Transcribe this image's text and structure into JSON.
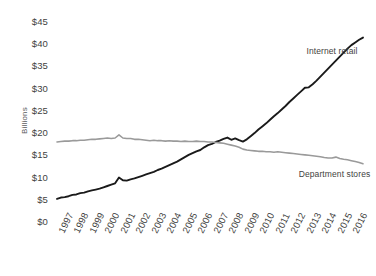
{
  "chart_data": {
    "type": "line",
    "title": "",
    "subtitle": "",
    "xlabel": "",
    "ylabel": "Billions",
    "xlim": [
      1997,
      2016.75
    ],
    "ylim": [
      0,
      45
    ],
    "grid": false,
    "legend_position": "inline-annotation",
    "y_ticks": [
      "$0",
      "$5",
      "$10",
      "$15",
      "$20",
      "$25",
      "$30",
      "$35",
      "$40",
      "$45"
    ],
    "y_tick_values": [
      0,
      5,
      10,
      15,
      20,
      25,
      30,
      35,
      40,
      45
    ],
    "categories": [
      "1997",
      "1998",
      "1999",
      "2000",
      "2001",
      "2002",
      "2003",
      "2004",
      "2005",
      "2006",
      "2007",
      "2008",
      "2009",
      "2010",
      "2011",
      "2012",
      "2013",
      "2014",
      "2015",
      "2016"
    ],
    "colors": {
      "internet_retail": "#1a1a1a",
      "department_stores": "#9a9a9a",
      "text": "#3f3f41",
      "axis_label": "#58595b",
      "background": "#ffffff"
    },
    "series": [
      {
        "name": "Internet retail",
        "color": "#1a1a1a",
        "label_x": 2013.1,
        "label_y": 38.2,
        "x": [
          1997.0,
          1997.25,
          1997.5,
          1997.75,
          1998.0,
          1998.25,
          1998.5,
          1998.75,
          1999.0,
          1999.25,
          1999.5,
          1999.75,
          2000.0,
          2000.25,
          2000.5,
          2000.75,
          2001.0,
          2001.25,
          2001.5,
          2001.75,
          2002.0,
          2002.25,
          2002.5,
          2002.75,
          2003.0,
          2003.25,
          2003.5,
          2003.75,
          2004.0,
          2004.25,
          2004.5,
          2004.75,
          2005.0,
          2005.25,
          2005.5,
          2005.75,
          2006.0,
          2006.25,
          2006.5,
          2006.75,
          2007.0,
          2007.25,
          2007.5,
          2007.75,
          2008.0,
          2008.25,
          2008.5,
          2008.75,
          2009.0,
          2009.25,
          2009.5,
          2009.75,
          2010.0,
          2010.25,
          2010.5,
          2010.75,
          2011.0,
          2011.25,
          2011.5,
          2011.75,
          2012.0,
          2012.25,
          2012.5,
          2012.75,
          2013.0,
          2013.25,
          2013.5,
          2013.75,
          2014.0,
          2014.25,
          2014.5,
          2014.75,
          2015.0,
          2015.25,
          2015.5,
          2015.75,
          2016.0,
          2016.25,
          2016.5,
          2016.75
        ],
        "values": [
          5.2,
          5.5,
          5.6,
          5.8,
          6.1,
          6.2,
          6.5,
          6.6,
          6.9,
          7.1,
          7.3,
          7.5,
          7.8,
          8.1,
          8.4,
          8.7,
          10.0,
          9.4,
          9.3,
          9.6,
          9.8,
          10.1,
          10.4,
          10.7,
          11.0,
          11.3,
          11.7,
          12.0,
          12.4,
          12.8,
          13.2,
          13.6,
          14.1,
          14.6,
          15.1,
          15.5,
          15.9,
          16.2,
          16.8,
          17.3,
          17.6,
          18.0,
          18.3,
          18.7,
          19.0,
          18.5,
          18.8,
          18.4,
          18.1,
          18.6,
          19.3,
          20.0,
          20.8,
          21.5,
          22.2,
          23.0,
          23.8,
          24.5,
          25.3,
          26.1,
          27.0,
          27.8,
          28.6,
          29.4,
          30.2,
          30.3,
          31.0,
          31.8,
          32.7,
          33.6,
          34.5,
          35.4,
          36.3,
          37.2,
          38.1,
          39.0,
          39.8,
          40.4,
          41.0,
          41.5
        ]
      },
      {
        "name": "Department stores",
        "color": "#9a9a9a",
        "label_x": 2012.6,
        "label_y": 10.6,
        "x": [
          1997.0,
          1997.25,
          1997.5,
          1997.75,
          1998.0,
          1998.25,
          1998.5,
          1998.75,
          1999.0,
          1999.25,
          1999.5,
          1999.75,
          2000.0,
          2000.25,
          2000.5,
          2000.75,
          2001.0,
          2001.25,
          2001.5,
          2001.75,
          2002.0,
          2002.25,
          2002.5,
          2002.75,
          2003.0,
          2003.25,
          2003.5,
          2003.75,
          2004.0,
          2004.25,
          2004.5,
          2004.75,
          2005.0,
          2005.25,
          2005.5,
          2005.75,
          2006.0,
          2006.25,
          2006.5,
          2006.75,
          2007.0,
          2007.25,
          2007.5,
          2007.75,
          2008.0,
          2008.25,
          2008.5,
          2008.75,
          2009.0,
          2009.25,
          2009.5,
          2009.75,
          2010.0,
          2010.25,
          2010.5,
          2010.75,
          2011.0,
          2011.25,
          2011.5,
          2011.75,
          2012.0,
          2012.25,
          2012.5,
          2012.75,
          2013.0,
          2013.25,
          2013.5,
          2013.75,
          2014.0,
          2014.25,
          2014.5,
          2014.75,
          2015.0,
          2015.25,
          2015.5,
          2015.75,
          2016.0,
          2016.25,
          2016.5,
          2016.75
        ],
        "values": [
          18.0,
          18.1,
          18.2,
          18.2,
          18.3,
          18.3,
          18.4,
          18.4,
          18.5,
          18.6,
          18.6,
          18.7,
          18.8,
          18.9,
          18.8,
          18.9,
          19.6,
          18.9,
          18.8,
          18.8,
          18.6,
          18.6,
          18.5,
          18.4,
          18.3,
          18.4,
          18.3,
          18.3,
          18.2,
          18.3,
          18.2,
          18.2,
          18.1,
          18.2,
          18.1,
          18.1,
          18.2,
          18.1,
          18.1,
          18.0,
          18.0,
          17.9,
          17.8,
          17.7,
          17.5,
          17.3,
          17.1,
          16.8,
          16.4,
          16.2,
          16.1,
          16.0,
          15.9,
          15.9,
          15.8,
          15.8,
          15.7,
          15.8,
          15.7,
          15.6,
          15.5,
          15.4,
          15.3,
          15.2,
          15.1,
          15.0,
          14.9,
          14.8,
          14.7,
          14.5,
          14.4,
          14.4,
          14.6,
          14.3,
          14.1,
          14.0,
          13.8,
          13.6,
          13.4,
          13.1
        ]
      }
    ]
  }
}
